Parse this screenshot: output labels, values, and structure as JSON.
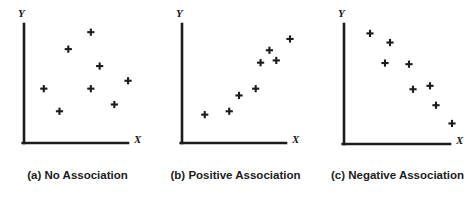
{
  "figure": {
    "background_color": "#ffffff",
    "ink_color": "#1b1c1e",
    "width": 476,
    "height": 202
  },
  "panels": [
    {
      "id": "panel-a",
      "caption_tag": "(a)",
      "caption_text": "No Association",
      "caption_full": "(a) No Association",
      "x_axis_label": "X",
      "y_axis_label": "Y",
      "left": 0,
      "axis_origin": {
        "x": 24,
        "y": 143
      },
      "axis_top": 24,
      "axis_right": 128,
      "x_label_pos": {
        "x": 134,
        "y": 134
      },
      "y_label_pos": {
        "x": 18,
        "y": 8
      }
    },
    {
      "id": "panel-b",
      "caption_tag": "(b)",
      "caption_text": "Positive Association",
      "caption_full": "(b) Positive Association",
      "x_axis_label": "X",
      "y_axis_label": "Y",
      "left": 158,
      "axis_origin": {
        "x": 24,
        "y": 143
      },
      "axis_top": 24,
      "axis_right": 128,
      "x_label_pos": {
        "x": 134,
        "y": 134
      },
      "y_label_pos": {
        "x": 18,
        "y": 8
      }
    },
    {
      "id": "panel-c",
      "caption_tag": "(c)",
      "caption_text": "Negative Association",
      "caption_full": "(c) Negative Association",
      "x_axis_label": "X",
      "y_axis_label": "Y",
      "left": 320,
      "axis_origin": {
        "x": 24,
        "y": 144
      },
      "axis_top": 24,
      "axis_right": 130,
      "x_label_pos": {
        "x": 136,
        "y": 135
      },
      "y_label_pos": {
        "x": 18,
        "y": 8
      }
    }
  ],
  "chart_data": [
    {
      "type": "scatter",
      "title": "(a) No Association",
      "xlabel": "X",
      "ylabel": "Y",
      "marker": "plus",
      "grid": false,
      "legend": "none",
      "xlim": [
        0,
        100
      ],
      "ylim": [
        0,
        100
      ],
      "axis_ticks": "none",
      "points": [
        {
          "x": 58,
          "y": 91
        },
        {
          "x": 35,
          "y": 76
        },
        {
          "x": 67,
          "y": 61
        },
        {
          "x": 10,
          "y": 41
        },
        {
          "x": 58,
          "y": 41
        },
        {
          "x": 96,
          "y": 48
        },
        {
          "x": 82,
          "y": 27
        },
        {
          "x": 26,
          "y": 21
        }
      ]
    },
    {
      "type": "scatter",
      "title": "(b) Positive Association",
      "xlabel": "X",
      "ylabel": "Y",
      "marker": "plus",
      "grid": false,
      "legend": "none",
      "xlim": [
        0,
        100
      ],
      "ylim": [
        0,
        100
      ],
      "axis_ticks": "none",
      "points": [
        {
          "x": 13,
          "y": 18
        },
        {
          "x": 38,
          "y": 21
        },
        {
          "x": 48,
          "y": 35
        },
        {
          "x": 65,
          "y": 41
        },
        {
          "x": 70,
          "y": 64
        },
        {
          "x": 86,
          "y": 66
        },
        {
          "x": 79,
          "y": 75
        },
        {
          "x": 100,
          "y": 85
        }
      ]
    },
    {
      "type": "scatter",
      "title": "(c) Negative Association",
      "xlabel": "X",
      "ylabel": "Y",
      "marker": "plus",
      "grid": false,
      "legend": "none",
      "xlim": [
        0,
        100
      ],
      "ylim": [
        0,
        100
      ],
      "axis_ticks": "none",
      "points": [
        {
          "x": 16,
          "y": 90
        },
        {
          "x": 36,
          "y": 82
        },
        {
          "x": 31,
          "y": 64
        },
        {
          "x": 55,
          "y": 63
        },
        {
          "x": 59,
          "y": 41
        },
        {
          "x": 76,
          "y": 44
        },
        {
          "x": 82,
          "y": 27
        },
        {
          "x": 98,
          "y": 11
        }
      ]
    }
  ]
}
